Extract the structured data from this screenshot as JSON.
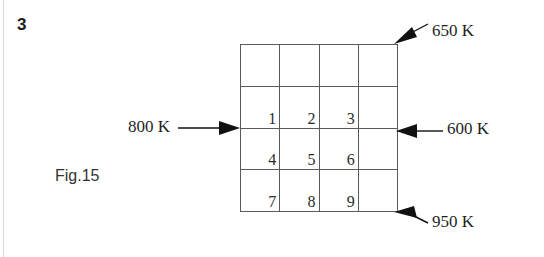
{
  "figure": {
    "problem_number": "3",
    "caption": "Fig.15"
  },
  "grid": {
    "rows": 4,
    "columns": 4,
    "cells": [
      {
        "label": "",
        "name": "cell-r1c1"
      },
      {
        "label": "",
        "name": "cell-r1c2"
      },
      {
        "label": "",
        "name": "cell-r1c3"
      },
      {
        "label": "",
        "name": "cell-r1c4"
      },
      {
        "label": "1",
        "name": "cell-r2c1"
      },
      {
        "label": "2",
        "name": "cell-r2c2"
      },
      {
        "label": "3",
        "name": "cell-r2c3"
      },
      {
        "label": "",
        "name": "cell-r2c4"
      },
      {
        "label": "4",
        "name": "cell-r3c1"
      },
      {
        "label": "5",
        "name": "cell-r3c2"
      },
      {
        "label": "6",
        "name": "cell-r3c3"
      },
      {
        "label": "",
        "name": "cell-r3c4"
      },
      {
        "label": "7",
        "name": "cell-r4c1"
      },
      {
        "label": "8",
        "name": "cell-r4c2"
      },
      {
        "label": "9",
        "name": "cell-r4c3"
      },
      {
        "label": "",
        "name": "cell-r4c4"
      }
    ]
  },
  "annotations": {
    "left": "800 K",
    "top_right": "650 K",
    "middle_right": "600 K",
    "bottom_right": "950 K"
  },
  "colors": {
    "grid_line": "#5a5a5a",
    "text": "#1f1f1f",
    "arrow": "#111111",
    "background": "#ffffff"
  }
}
